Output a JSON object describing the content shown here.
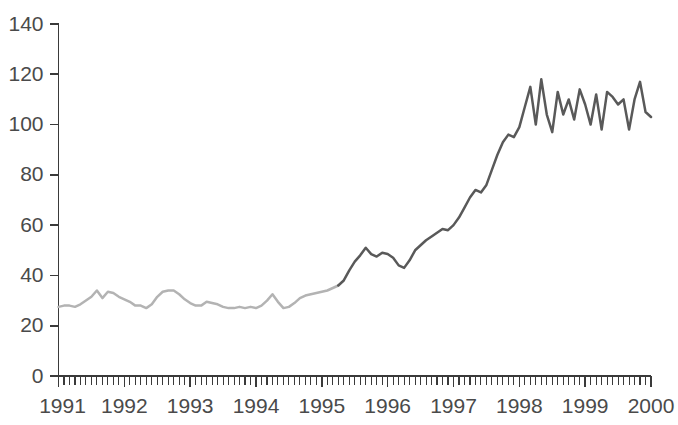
{
  "chart_data": {
    "type": "line",
    "title": "",
    "subtitle": "",
    "xlabel": "",
    "ylabel": "",
    "xlim": [
      1991.0,
      2000.0
    ],
    "ylim": [
      0,
      140
    ],
    "grid": false,
    "legend": null,
    "y_ticks": [
      0,
      20,
      40,
      60,
      80,
      100,
      120,
      140
    ],
    "y_tick_labels": [
      "0",
      "20",
      "40",
      "60",
      "80",
      "100",
      "120",
      "140"
    ],
    "x_ticks": [
      1991,
      1992,
      1993,
      1994,
      1995,
      1996,
      1997,
      1998,
      1999,
      2000
    ],
    "x_tick_labels": [
      "1991",
      "1992",
      "1993",
      "1994",
      "1995",
      "1996",
      "1997",
      "1998",
      "1999",
      "2000"
    ],
    "x_minor_tick_interval_months": 1,
    "colors": {
      "series_early": "#b3b3b3",
      "series_late": "#595959",
      "axis": "#3a3a3a",
      "tick_label": "#4a4a4a",
      "background": "#ffffff"
    },
    "series": [
      {
        "name": "Index (light segment, 1991-1995)",
        "color": "#b3b3b3",
        "x": [
          1991.0,
          1991.083,
          1991.167,
          1991.25,
          1991.333,
          1991.417,
          1991.5,
          1991.583,
          1991.667,
          1991.75,
          1991.833,
          1991.917,
          1992.0,
          1992.083,
          1992.167,
          1992.25,
          1992.333,
          1992.417,
          1992.5,
          1992.583,
          1992.667,
          1992.75,
          1992.833,
          1992.917,
          1993.0,
          1993.083,
          1993.167,
          1993.25,
          1993.333,
          1993.417,
          1993.5,
          1993.583,
          1993.667,
          1993.75,
          1993.833,
          1993.917,
          1994.0,
          1994.083,
          1994.167,
          1994.25,
          1994.333,
          1994.417,
          1994.5,
          1994.583,
          1994.667,
          1994.75,
          1994.833,
          1994.917,
          1995.0,
          1995.083,
          1995.167,
          1995.25
        ],
        "values": [
          27.5,
          28.0,
          28.0,
          27.5,
          28.5,
          30.0,
          31.5,
          34.0,
          31.0,
          33.5,
          33.0,
          31.5,
          30.5,
          29.5,
          28.0,
          28.0,
          27.0,
          28.5,
          31.5,
          33.5,
          34.0,
          34.0,
          32.5,
          30.5,
          29.0,
          28.0,
          28.0,
          29.5,
          29.0,
          28.5,
          27.5,
          27.0,
          27.0,
          27.5,
          27.0,
          27.5,
          27.0,
          28.0,
          30.0,
          32.5,
          29.5,
          27.0,
          27.5,
          29.0,
          31.0,
          32.0,
          32.5,
          33.0,
          33.5,
          34.0,
          35.0,
          36.0
        ]
      },
      {
        "name": "Index (dark segment, 1995-2000)",
        "color": "#595959",
        "x": [
          1995.25,
          1995.333,
          1995.417,
          1995.5,
          1995.583,
          1995.667,
          1995.75,
          1995.833,
          1995.917,
          1996.0,
          1996.083,
          1996.167,
          1996.25,
          1996.333,
          1996.417,
          1996.5,
          1996.583,
          1996.667,
          1996.75,
          1996.833,
          1996.917,
          1997.0,
          1997.083,
          1997.167,
          1997.25,
          1997.333,
          1997.417,
          1997.5,
          1997.583,
          1997.667,
          1997.75,
          1997.833,
          1997.917,
          1998.0,
          1998.083,
          1998.167,
          1998.25,
          1998.333,
          1998.417,
          1998.5,
          1998.583,
          1998.667,
          1998.75,
          1998.833,
          1998.917,
          1999.0,
          1999.083,
          1999.167,
          1999.25,
          1999.333,
          1999.417,
          1999.5,
          1999.583,
          1999.667,
          1999.75,
          1999.833,
          1999.917,
          2000.0
        ],
        "values": [
          36.0,
          38.0,
          42.0,
          45.5,
          48.0,
          51.0,
          48.5,
          47.5,
          49.0,
          48.5,
          47.0,
          44.0,
          43.0,
          46.0,
          50.0,
          52.0,
          54.0,
          55.5,
          57.0,
          58.5,
          58.0,
          60.0,
          63.0,
          67.0,
          71.0,
          74.0,
          73.0,
          76.0,
          82.0,
          88.0,
          93.0,
          96.0,
          95.0,
          99.0,
          107.0,
          115.0,
          100.0,
          118.0,
          104.0,
          97.0,
          113.0,
          104.0,
          110.0,
          102.0,
          114.0,
          108.0,
          100.0,
          112.0,
          98.0,
          113.0,
          111.0,
          108.0,
          110.0,
          98.0,
          110.0,
          117.0,
          105.0,
          103.0
        ]
      }
    ]
  },
  "axes": {
    "y_axis_name": "value-axis",
    "x_axis_name": "year-axis"
  }
}
